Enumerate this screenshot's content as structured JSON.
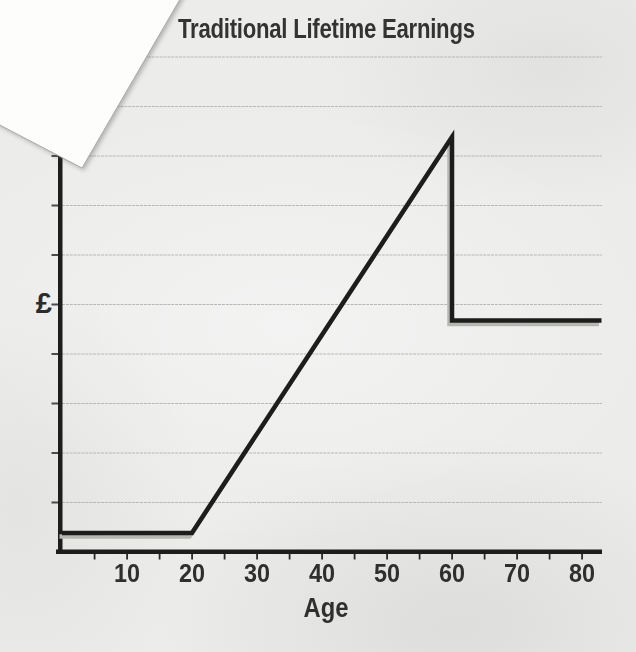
{
  "colors": {
    "paper": "#ecedeb",
    "overlay_corner": "#fdfdfc",
    "line": "#1d1d1b",
    "line_shadow": "#b6b6b3",
    "grid": "#aeaeac",
    "axis": "#1d1d1b",
    "text": "#2f2f2d"
  },
  "chart_data": {
    "type": "line",
    "title": "Traditional Lifetime Earnings",
    "xlabel": "Age",
    "ylabel": "£",
    "x_range": [
      0,
      83
    ],
    "x_ticks_labeled": [
      10,
      20,
      30,
      40,
      50,
      60,
      70,
      80
    ],
    "x_minor_tick_step": 5,
    "y_range_relative": [
      0,
      1.2
    ],
    "y_axis_numeric_labels": false,
    "grid": "horizontal",
    "gridline_count": 10,
    "legend": "none",
    "series": [
      {
        "name": "earnings",
        "points": [
          [
            0,
            0.046
          ],
          [
            20,
            0.046
          ],
          [
            60,
            1.0
          ],
          [
            60,
            0.558
          ],
          [
            83,
            0.558
          ]
        ],
        "shape_note": "flat low until age 20, linear rise to peak at 60, vertical drop at 60, flat lower level to end"
      }
    ]
  }
}
